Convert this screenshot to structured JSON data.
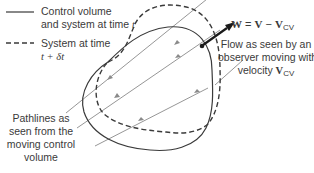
{
  "legend": {
    "solid": {
      "line1": "Control volume",
      "line2": "and system at time",
      "var": "t"
    },
    "dashed": {
      "line1": "System at time",
      "var": "t + δt"
    }
  },
  "equation": {
    "lhs": "W",
    "eq": " = ",
    "v": "V",
    "minus": " − ",
    "vcv": "V",
    "sub": "CV"
  },
  "flow_label": {
    "line1": "Flow as seen by an",
    "line2": "observer moving with",
    "line3": "velocity ",
    "vcv": "V",
    "sub": "CV"
  },
  "pathlines_label": {
    "line1": "Pathlines as",
    "line2": "seen from the",
    "line3": "moving control",
    "line4": "volume"
  },
  "colors": {
    "curve": "#3a3a3a",
    "pathline": "#8a8a8a",
    "arrow": "#1a1a1a"
  }
}
